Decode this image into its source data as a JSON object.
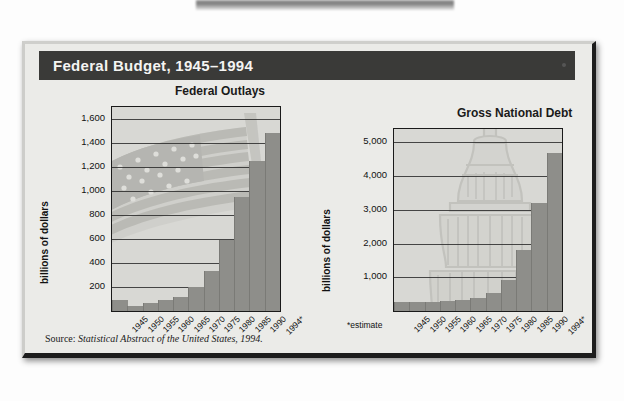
{
  "panel": {
    "title": "Federal Budget, 1945–1994",
    "source_prefix": "Source: ",
    "source_italic": "Statistical Abstract of the United States, 1994."
  },
  "chart_data": [
    {
      "type": "bar",
      "title": "Federal Outlays",
      "ylabel": "billions of dollars",
      "xlabel": "",
      "categories": [
        "1945",
        "1950",
        "1955",
        "1960",
        "1965",
        "1970",
        "1975",
        "1980",
        "1985",
        "1990",
        "1994*"
      ],
      "values": [
        93,
        43,
        68,
        92,
        118,
        196,
        332,
        591,
        946,
        1253,
        1484
      ],
      "yticks": [
        "200",
        "400",
        "600",
        "800",
        "1,000",
        "1,200",
        "1,400",
        "1,600"
      ],
      "ytick_values": [
        200,
        400,
        600,
        800,
        1000,
        1200,
        1400,
        1600
      ],
      "ylim": [
        0,
        1700
      ],
      "grid": true,
      "legend": "none",
      "watermark": "american-flag"
    },
    {
      "type": "bar",
      "title": "Gross National Debt",
      "ylabel": "billions of dollars",
      "xlabel": "",
      "categories": [
        "1945",
        "1950",
        "1955",
        "1960",
        "1965",
        "1970",
        "1975",
        "1980",
        "1985",
        "1990",
        "1994*"
      ],
      "values": [
        260,
        257,
        274,
        291,
        322,
        381,
        542,
        909,
        1817,
        3207,
        4676
      ],
      "yticks": [
        "1,000",
        "2,000",
        "3,000",
        "4,000",
        "5,000"
      ],
      "ytick_values": [
        1000,
        2000,
        3000,
        4000,
        5000
      ],
      "ylim": [
        0,
        5400
      ],
      "grid": true,
      "legend": "none",
      "footnote": "*estimate",
      "watermark": "capitol-dome"
    }
  ],
  "colors": {
    "title_bar": "#3a3a38",
    "plate": "#ebebe8",
    "plot_bg": "#d8d8d4",
    "bar": "#8e8e8a",
    "axis": "#1a1a1a"
  }
}
